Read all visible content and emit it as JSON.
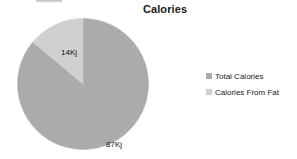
{
  "chart_data": {
    "type": "pie",
    "title": "Calories",
    "categories": [
      "Total Calories",
      "Calories From Fat"
    ],
    "values": [
      87,
      14
    ],
    "value_labels": [
      "87Kj",
      "14Kj"
    ],
    "unit": "Kj",
    "colors": [
      "#ababab",
      "#d0d0d0"
    ],
    "legend_position": "right",
    "start_angle_deg": 0,
    "direction": "clockwise",
    "slices": [
      {
        "name": "Total Calories",
        "value": 87,
        "label": "87Kj",
        "color": "#ababab",
        "percent": 86.1,
        "start_deg": 0,
        "sweep_deg": 310
      },
      {
        "name": "Calories From Fat",
        "value": 14,
        "label": "14Kj",
        "color": "#d0d0d0",
        "percent": 13.9,
        "start_deg": 310,
        "sweep_deg": 50
      }
    ],
    "xlabel": "",
    "ylabel": "",
    "grid": false
  },
  "legend": {
    "items": [
      {
        "label": "Total Calories",
        "color": "#ababab"
      },
      {
        "label": "Calories From Fat",
        "color": "#d0d0d0"
      }
    ]
  },
  "colors": {
    "background": "#ffffff",
    "title_text": "#1a1a1a",
    "label_text": "#111111",
    "series_major": "#ababab",
    "series_minor": "#d0d0d0"
  }
}
